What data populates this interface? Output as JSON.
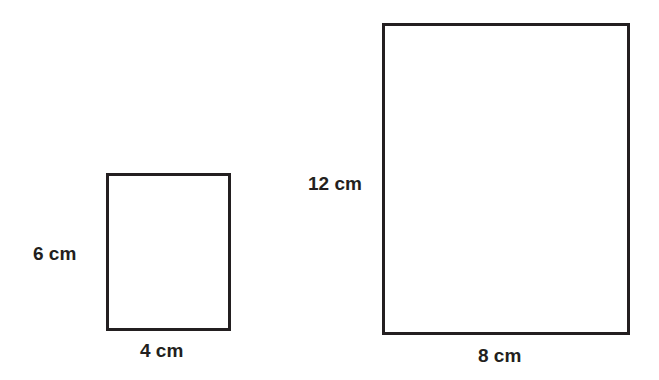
{
  "diagram": {
    "shapes": [
      {
        "id": "small-rectangle",
        "height_label": "6 cm",
        "width_label": "4 cm",
        "height": 6,
        "width": 4,
        "unit": "cm"
      },
      {
        "id": "large-rectangle",
        "height_label": "12 cm",
        "width_label": "8 cm",
        "height": 12,
        "width": 8,
        "unit": "cm"
      }
    ],
    "colors": {
      "stroke": "#231f20",
      "background": "#ffffff"
    }
  }
}
